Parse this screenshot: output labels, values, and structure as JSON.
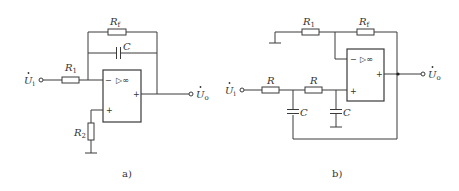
{
  "figure": {
    "panels": [
      {
        "id": "a",
        "caption": "a)",
        "opamp": {
          "symbol": "▷∞",
          "inverting_sign": "−",
          "noninverting_sign": "+",
          "output_sign": "+"
        },
        "components": {
          "Rf": {
            "label": "R",
            "sub": "f"
          },
          "C": {
            "label": "C"
          },
          "R1": {
            "label": "R",
            "sub": "1"
          },
          "R2": {
            "label": "R",
            "sub": "2"
          }
        },
        "input": {
          "label": "U",
          "sub": "i",
          "dot": "•"
        },
        "output": {
          "label": "U",
          "sub": "o",
          "dot": "•"
        }
      },
      {
        "id": "b",
        "caption": "b)",
        "opamp": {
          "symbol": "▷∞",
          "inverting_sign": "−",
          "noninverting_sign": "+",
          "output_sign": "+"
        },
        "components": {
          "R1": {
            "label": "R",
            "sub": "1"
          },
          "Rf": {
            "label": "R",
            "sub": "f"
          },
          "Ra": {
            "label": "R"
          },
          "Rb": {
            "label": "R"
          },
          "Ca": {
            "label": "C"
          },
          "Cb": {
            "label": "C"
          }
        },
        "input": {
          "label": "U",
          "sub": "i",
          "dot": "•"
        },
        "output": {
          "label": "U",
          "sub": "o",
          "dot": "•"
        }
      }
    ]
  }
}
